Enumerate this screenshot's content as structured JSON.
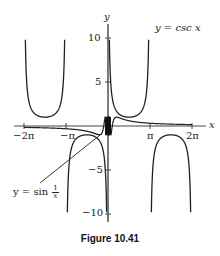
{
  "chart_data": {
    "type": "line",
    "title": "",
    "caption": "Figure 10.41",
    "xlabel": "x",
    "ylabel": "y",
    "xlim": [
      -6.8,
      7.2
    ],
    "ylim": [
      -11,
      11.5
    ],
    "grid": false,
    "x_ticks": [
      {
        "value": -6.2832,
        "label": "−2π"
      },
      {
        "value": -3.1416,
        "label": "−π"
      },
      {
        "value": 3.1416,
        "label": "π"
      },
      {
        "value": 6.2832,
        "label": "2π"
      }
    ],
    "y_ticks": [
      {
        "value": 10,
        "label": "10"
      },
      {
        "value": 5,
        "label": "5"
      },
      {
        "value": -5,
        "label": "−5"
      },
      {
        "value": -10,
        "label": "−10"
      }
    ],
    "series": [
      {
        "name": "y = csc x",
        "function": "csc(x)",
        "domain": [
          -6.2832,
          6.2832
        ],
        "clip": [
          -10,
          10
        ]
      },
      {
        "name": "y = sin 1/x",
        "function": "sin(1/x)",
        "domain": [
          -6.2832,
          6.2832
        ]
      }
    ],
    "annotations": [
      {
        "text": "y = csc x",
        "position": "upper right"
      },
      {
        "text": "y = sin 1/x",
        "position": "lower left",
        "pointer": true
      }
    ]
  },
  "labels": {
    "x_axis": "x",
    "y_axis": "y",
    "csc_label": "y = csc x",
    "sin_label_prefix": "y = sin",
    "sin_frac_num": "1",
    "sin_frac_den": "x",
    "tick_neg2pi": "−2π",
    "tick_negpi": "−π",
    "tick_pi": "π",
    "tick_2pi": "2π",
    "tick_10": "10",
    "tick_5": "5",
    "tick_neg5": "−5",
    "tick_neg10": "−10",
    "caption": "Figure 10.41"
  }
}
